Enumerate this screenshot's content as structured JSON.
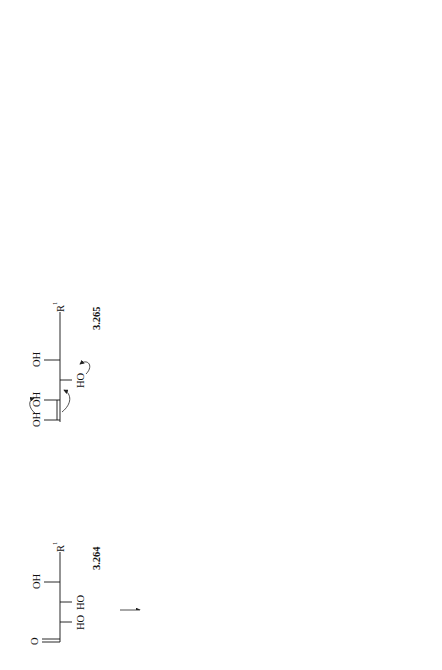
{
  "figure": {
    "orientation": "rotated 90 degrees counter-clockwise",
    "panels": [
      "(a)",
      "(b)",
      "(c)"
    ]
  },
  "compounds": {
    "c3264": {
      "id": "3.264"
    },
    "c3265": {
      "id": "3.265"
    },
    "c3266": {
      "id": "3.266"
    },
    "c3267": {
      "id": "3.267"
    },
    "c3268a": {
      "id": "3.268a"
    },
    "c3268b": {
      "id": "3.268b"
    },
    "c3269": {
      "id": "3.269"
    },
    "c3270": {
      "id": "3.270"
    },
    "c3271": {
      "id": "3.271"
    },
    "c3272a": {
      "id": "3.272a"
    },
    "c3272b": {
      "id": "3.272b"
    },
    "c3273": {
      "id": "3.273"
    },
    "c3274a": {
      "id": "3.274a"
    },
    "c3274b": {
      "id": "3.274b"
    }
  },
  "product_names": {
    "a_line1": "3-Deoxyhexonic acids",
    "a_line2": "(Metasaccharinic acids)",
    "b_line1": "3-Deoxy-2-C-(hydroxymethyl)pentonic acids",
    "b_line2": "(Isosaccharinic acids)",
    "c_line1": "2-C-Methylpentonic acids",
    "c_line2": "(Saccharinic acids)"
  },
  "conditions": {
    "benzilic1": "benzilic",
    "benzilic2": "acid",
    "benzilic3": "rearrangement",
    "minus_h2o": "-H₂O",
    "plus_h2o": "+H₂O"
  },
  "atoms": {
    "O": "O",
    "OH": "OH",
    "HO": "HO",
    "H": "H",
    "Me": "Me",
    "R": "R",
    "R1_sup": "1",
    "R2_sup": "2",
    "OHR2": "OH(R",
    "R1_def": "R",
    "eq": " ="
  }
}
